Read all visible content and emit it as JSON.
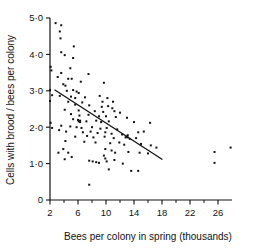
{
  "chart_data": {
    "type": "scatter",
    "title": "",
    "xlabel": "Bees per colony in spring (thousands)",
    "ylabel": "Cells with brood / bees per colony",
    "xlim": [
      2,
      28
    ],
    "ylim": [
      0,
      5.0
    ],
    "grid": false,
    "legend": null,
    "xticks": [
      2,
      6,
      10,
      14,
      18,
      22,
      26
    ],
    "xticklabels": [
      "2",
      "6",
      "10",
      "14",
      "18",
      "22",
      "26"
    ],
    "xminorticks": [
      4,
      8,
      12,
      16,
      20,
      24
    ],
    "yticks": [
      0,
      1.0,
      2.0,
      3.0,
      4.0,
      5.0
    ],
    "yticklabels": [
      "0",
      "1·0",
      "2·0",
      "3·0",
      "4·0",
      "5·0"
    ],
    "marker_color": "#111111",
    "line_color": "#111111",
    "trendline": {
      "label": "regression line",
      "x": [
        2.7,
        18.0
      ],
      "y": [
        3.02,
        1.12
      ]
    },
    "points": [
      {
        "x": 2.8,
        "y": 4.86
      },
      {
        "x": 3.6,
        "y": 4.8
      },
      {
        "x": 3.4,
        "y": 4.63
      },
      {
        "x": 3.5,
        "y": 4.44
      },
      {
        "x": 5.4,
        "y": 4.22
      },
      {
        "x": 3.6,
        "y": 4.06
      },
      {
        "x": 4.1,
        "y": 3.98
      },
      {
        "x": 5.3,
        "y": 3.9
      },
      {
        "x": 2.1,
        "y": 3.66
      },
      {
        "x": 4.9,
        "y": 3.62
      },
      {
        "x": 2.2,
        "y": 3.56
      },
      {
        "x": 3.6,
        "y": 3.49
      },
      {
        "x": 7.5,
        "y": 3.46
      },
      {
        "x": 3.1,
        "y": 3.38
      },
      {
        "x": 4.6,
        "y": 3.33
      },
      {
        "x": 5.1,
        "y": 3.33
      },
      {
        "x": 6.4,
        "y": 3.25
      },
      {
        "x": 9.7,
        "y": 3.22
      },
      {
        "x": 3.9,
        "y": 3.18
      },
      {
        "x": 4.2,
        "y": 3.14
      },
      {
        "x": 2.0,
        "y": 3.02
      },
      {
        "x": 4.4,
        "y": 3.0
      },
      {
        "x": 5.3,
        "y": 3.02
      },
      {
        "x": 5.8,
        "y": 2.98
      },
      {
        "x": 6.1,
        "y": 2.94
      },
      {
        "x": 2.3,
        "y": 2.88
      },
      {
        "x": 3.4,
        "y": 2.86
      },
      {
        "x": 5.0,
        "y": 2.84
      },
      {
        "x": 5.6,
        "y": 2.8
      },
      {
        "x": 7.0,
        "y": 2.82
      },
      {
        "x": 9.1,
        "y": 2.86
      },
      {
        "x": 10.2,
        "y": 2.8
      },
      {
        "x": 2.0,
        "y": 2.72
      },
      {
        "x": 4.6,
        "y": 2.7
      },
      {
        "x": 6.6,
        "y": 2.68
      },
      {
        "x": 9.5,
        "y": 2.7
      },
      {
        "x": 11.0,
        "y": 2.7
      },
      {
        "x": 5.6,
        "y": 2.62
      },
      {
        "x": 7.6,
        "y": 2.6
      },
      {
        "x": 9.4,
        "y": 2.56
      },
      {
        "x": 10.3,
        "y": 2.58
      },
      {
        "x": 10.9,
        "y": 2.52
      },
      {
        "x": 4.1,
        "y": 2.48
      },
      {
        "x": 6.1,
        "y": 2.46
      },
      {
        "x": 8.4,
        "y": 2.44
      },
      {
        "x": 9.6,
        "y": 2.42
      },
      {
        "x": 11.2,
        "y": 2.44
      },
      {
        "x": 12.0,
        "y": 2.4
      },
      {
        "x": 5.0,
        "y": 2.36
      },
      {
        "x": 6.2,
        "y": 2.32
      },
      {
        "x": 7.5,
        "y": 2.34
      },
      {
        "x": 9.0,
        "y": 2.3
      },
      {
        "x": 10.0,
        "y": 2.3
      },
      {
        "x": 11.4,
        "y": 2.28
      },
      {
        "x": 13.0,
        "y": 2.26
      },
      {
        "x": 5.3,
        "y": 2.22
      },
      {
        "x": 6.0,
        "y": 2.2
      },
      {
        "x": 6.3,
        "y": 2.18
      },
      {
        "x": 7.2,
        "y": 2.16
      },
      {
        "x": 8.6,
        "y": 2.18
      },
      {
        "x": 9.3,
        "y": 2.14
      },
      {
        "x": 10.4,
        "y": 2.16
      },
      {
        "x": 14.0,
        "y": 2.14
      },
      {
        "x": 16.3,
        "y": 2.12
      },
      {
        "x": 3.6,
        "y": 2.04
      },
      {
        "x": 4.9,
        "y": 2.02
      },
      {
        "x": 5.8,
        "y": 2.0
      },
      {
        "x": 6.5,
        "y": 1.98
      },
      {
        "x": 8.0,
        "y": 2.0
      },
      {
        "x": 9.2,
        "y": 1.96
      },
      {
        "x": 10.1,
        "y": 1.98
      },
      {
        "x": 11.6,
        "y": 1.94
      },
      {
        "x": 3.3,
        "y": 1.92
      },
      {
        "x": 4.3,
        "y": 1.88
      },
      {
        "x": 6.7,
        "y": 1.86
      },
      {
        "x": 7.8,
        "y": 1.88
      },
      {
        "x": 8.8,
        "y": 1.84
      },
      {
        "x": 9.9,
        "y": 1.86
      },
      {
        "x": 10.8,
        "y": 1.82
      },
      {
        "x": 12.3,
        "y": 1.8
      },
      {
        "x": 13.1,
        "y": 1.78
      },
      {
        "x": 14.6,
        "y": 1.86
      },
      {
        "x": 15.4,
        "y": 1.88
      },
      {
        "x": 5.6,
        "y": 1.74
      },
      {
        "x": 7.3,
        "y": 1.76
      },
      {
        "x": 8.2,
        "y": 1.72
      },
      {
        "x": 9.8,
        "y": 1.74
      },
      {
        "x": 11.1,
        "y": 1.7
      },
      {
        "x": 12.8,
        "y": 1.72
      },
      {
        "x": 13.4,
        "y": 1.68
      },
      {
        "x": 14.3,
        "y": 1.7
      },
      {
        "x": 4.2,
        "y": 1.62
      },
      {
        "x": 6.9,
        "y": 1.6
      },
      {
        "x": 8.5,
        "y": 1.58
      },
      {
        "x": 10.6,
        "y": 1.56
      },
      {
        "x": 11.9,
        "y": 1.58
      },
      {
        "x": 12.6,
        "y": 1.52
      },
      {
        "x": 15.0,
        "y": 1.54
      },
      {
        "x": 16.4,
        "y": 1.5
      },
      {
        "x": 17.2,
        "y": 1.44
      },
      {
        "x": 3.9,
        "y": 1.4
      },
      {
        "x": 9.9,
        "y": 1.4
      },
      {
        "x": 10.8,
        "y": 1.36
      },
      {
        "x": 11.3,
        "y": 1.3
      },
      {
        "x": 13.2,
        "y": 1.32
      },
      {
        "x": 14.8,
        "y": 1.3
      },
      {
        "x": 16.0,
        "y": 1.28
      },
      {
        "x": 25.5,
        "y": 1.32
      },
      {
        "x": 27.8,
        "y": 1.44
      },
      {
        "x": 4.1,
        "y": 1.12
      },
      {
        "x": 7.6,
        "y": 1.08
      },
      {
        "x": 8.1,
        "y": 1.06
      },
      {
        "x": 8.6,
        "y": 1.04
      },
      {
        "x": 9.0,
        "y": 1.02
      },
      {
        "x": 11.2,
        "y": 1.1
      },
      {
        "x": 12.4,
        "y": 1.0
      },
      {
        "x": 25.5,
        "y": 1.02
      },
      {
        "x": 10.4,
        "y": 0.84
      },
      {
        "x": 13.6,
        "y": 0.8
      },
      {
        "x": 14.6,
        "y": 0.8
      },
      {
        "x": 7.6,
        "y": 0.42
      },
      {
        "x": 9.7,
        "y": 1.22
      },
      {
        "x": 9.9,
        "y": 1.14
      },
      {
        "x": 10.1,
        "y": 1.06
      },
      {
        "x": 12.9,
        "y": 1.74
      },
      {
        "x": 13.1,
        "y": 1.72
      },
      {
        "x": 6.1,
        "y": 2.16
      },
      {
        "x": 6.3,
        "y": 2.14
      },
      {
        "x": 2.1,
        "y": 2.12
      },
      {
        "x": 2.3,
        "y": 1.98
      },
      {
        "x": 3.2,
        "y": 1.3
      },
      {
        "x": 4.6,
        "y": 1.3
      },
      {
        "x": 5.1,
        "y": 1.18
      }
    ]
  }
}
